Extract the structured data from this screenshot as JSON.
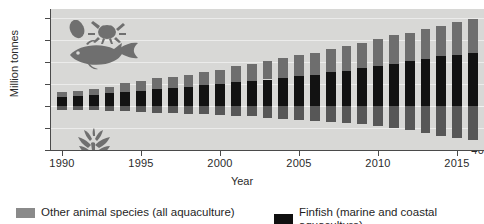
{
  "chart_data": {
    "type": "bar",
    "title": "",
    "subtitle": "",
    "xlabel": "Year",
    "ylabel": "Million tonnes",
    "stacked": true,
    "diverging": true,
    "grid": true,
    "legend_position": "bottom",
    "ylim": [
      -40,
      88
    ],
    "ytick_values": [
      80,
      60,
      40,
      20,
      0,
      -20,
      -40
    ],
    "ytick_labels": [
      "80",
      "60",
      "40",
      "20",
      "0",
      "20",
      "40"
    ],
    "xlim": [
      1989.3,
      2016.7
    ],
    "xtick_values": [
      1990,
      1995,
      2000,
      2005,
      2010,
      2015
    ],
    "xtick_labels": [
      "1990",
      "1995",
      "2000",
      "2005",
      "2010",
      "2015"
    ],
    "categories": [
      1990,
      1991,
      1992,
      1993,
      1994,
      1995,
      1996,
      1997,
      1998,
      1999,
      2000,
      2001,
      2002,
      2003,
      2004,
      2005,
      2006,
      2007,
      2008,
      2009,
      2010,
      2011,
      2012,
      2013,
      2014,
      2015,
      2016
    ],
    "series": [
      {
        "name": "Finfish (marine and coastal aquaculture)",
        "color": "#121212",
        "direction": "up",
        "values": [
          8.5,
          9.0,
          10.0,
          11.5,
          13.0,
          14.0,
          15.5,
          16.5,
          17.5,
          19.0,
          20.0,
          21.5,
          22.5,
          24.0,
          25.5,
          27.0,
          28.5,
          30.5,
          32.0,
          34.0,
          36.0,
          38.5,
          40.5,
          43.0,
          45.0,
          46.5,
          48.0
        ]
      },
      {
        "name": "Other animal species (all aquaculture)",
        "color": "#6e6e6e",
        "direction": "up",
        "values": [
          4.5,
          4.5,
          5.0,
          6.0,
          7.5,
          8.5,
          9.5,
          10.0,
          11.0,
          12.0,
          13.0,
          14.5,
          15.5,
          16.5,
          18.0,
          19.0,
          20.0,
          21.5,
          22.5,
          23.5,
          24.5,
          25.5,
          26.0,
          27.0,
          28.0,
          29.5,
          31.0
        ]
      },
      {
        "name": "Aquatic plants (below axis)",
        "color": "#575757",
        "direction": "down",
        "values": [
          3.5,
          3.5,
          4.0,
          4.5,
          5.0,
          5.5,
          6.0,
          6.5,
          7.0,
          7.5,
          8.0,
          9.0,
          9.5,
          10.5,
          11.5,
          12.5,
          13.5,
          14.5,
          15.5,
          16.5,
          18.0,
          20.0,
          22.0,
          25.0,
          27.0,
          29.0,
          30.5
        ]
      }
    ]
  },
  "axes": {
    "y_label": "Million tonnes",
    "x_label": "Year"
  },
  "legend": {
    "items": [
      {
        "id": "other",
        "label": "Other animal species (all aquaculture)",
        "color": "#8a8a8a"
      },
      {
        "id": "finfish",
        "label": "Finfish (marine and coastal aquaculture)",
        "color": "#101010"
      }
    ]
  },
  "icons": {
    "fauna": "fish-crab-shellfish-icon",
    "plants": "seaweed-icon"
  },
  "colors": {
    "plot_background": "#d8d8d6",
    "gridline": "#ececeb",
    "axis": "#4a4a4a",
    "finfish": "#121212",
    "other_animals": "#6e6e6e",
    "aquatic_plants": "#575757"
  }
}
